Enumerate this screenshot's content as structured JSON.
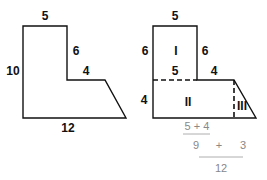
{
  "figure_left": {
    "labels": {
      "top": "5",
      "left": "10",
      "inner_vertical": "6",
      "inner_horizontal": "4",
      "bottom": "12"
    }
  },
  "figure_right": {
    "labels": {
      "top": "5",
      "left_upper": "6",
      "right_upper": "6",
      "divider": "5",
      "step": "4",
      "left_lower": "4"
    },
    "regions": {
      "one": "I",
      "two": "II",
      "three": "III"
    }
  },
  "calculation": {
    "line1": "5 + 4",
    "line2_left": "9",
    "line2_op": "+",
    "line2_right": "3",
    "line3": "12"
  },
  "colors": {
    "stroke": "#111111",
    "calc_text": "#888888"
  }
}
